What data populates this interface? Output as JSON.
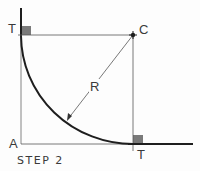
{
  "diagram": {
    "labels": {
      "tangent_top": "T",
      "center": "C",
      "radius": "R",
      "corner": "A",
      "tangent_bottom": "T"
    },
    "caption": "STEP 2",
    "colors": {
      "line": "#2b2b2b",
      "thin_line": "#555555",
      "right_angle_fill": "#7a7a7a"
    }
  }
}
